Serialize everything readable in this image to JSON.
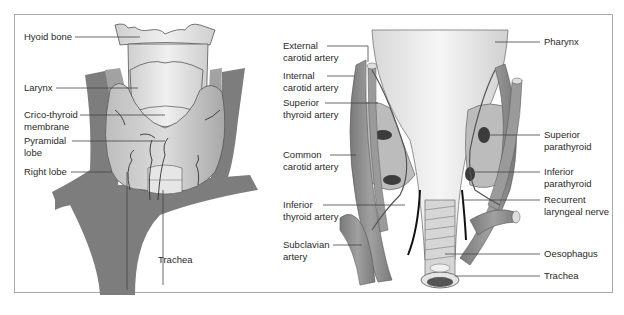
{
  "figure": {
    "left_panel": {
      "name": "anterior view of thyroid",
      "labels": [
        {
          "id": "hyoid",
          "lines": [
            "Hyoid bone"
          ]
        },
        {
          "id": "larynx",
          "lines": [
            "Larynx"
          ]
        },
        {
          "id": "crico",
          "lines": [
            "Crico-thyroid",
            "membrane"
          ]
        },
        {
          "id": "pyramidal",
          "lines": [
            "Pyramidal",
            "lobe"
          ]
        },
        {
          "id": "rightlobe",
          "lines": [
            "Right lobe"
          ]
        },
        {
          "id": "trachea",
          "lines": [
            "Trachea"
          ]
        }
      ]
    },
    "right_panel": {
      "name": "posterior view of thyroid and parathyroids",
      "labels_left": [
        {
          "id": "extcarotid",
          "lines": [
            "External",
            "carotid artery"
          ]
        },
        {
          "id": "intcarotid",
          "lines": [
            "Internal",
            "carotid artery"
          ]
        },
        {
          "id": "supthyroid",
          "lines": [
            "Superior",
            "thyroid artery"
          ]
        },
        {
          "id": "comcarotid",
          "lines": [
            "Common",
            "carotid artery"
          ]
        },
        {
          "id": "infthyroid",
          "lines": [
            "Inferior",
            "thyroid artery"
          ]
        },
        {
          "id": "subclavian",
          "lines": [
            "Subclavian",
            "artery"
          ]
        }
      ],
      "labels_right": [
        {
          "id": "pharynx",
          "lines": [
            "Pharynx"
          ]
        },
        {
          "id": "suppara",
          "lines": [
            "Superior",
            "parathyroid"
          ]
        },
        {
          "id": "infpara",
          "lines": [
            "Inferior",
            "parathyroid"
          ]
        },
        {
          "id": "recurrent",
          "lines": [
            "Recurrent",
            "laryngeal nerve"
          ]
        },
        {
          "id": "oesophagus",
          "lines": [
            "Oesophagus"
          ]
        },
        {
          "id": "trachea2",
          "lines": [
            "Trachea"
          ]
        }
      ]
    },
    "colors": {
      "artery": "#8c8c8c",
      "artery_dark": "#6e6e6e",
      "gland": "#b9b9b9",
      "cartilage": "#e2e2e2",
      "parathyroid": "#3c3c3c",
      "nerve": "#1a1a1a",
      "frame": "#a9a9a9",
      "leader": "#444444"
    }
  }
}
